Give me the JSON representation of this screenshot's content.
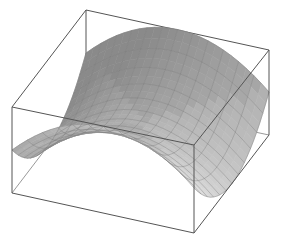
{
  "chart_data": {
    "type": "surface3d",
    "title": "",
    "xlabel": "",
    "ylabel": "",
    "zlabel": "",
    "function": "z = x^2 - y^2",
    "x_range": [
      -1,
      1
    ],
    "y_range": [
      -1,
      1
    ],
    "z_range": [
      -1,
      1
    ],
    "mesh_lines": 12,
    "grid": false,
    "legend": "none",
    "box": {
      "back_top": [
        86,
        10
      ],
      "right_top": [
        269,
        50
      ],
      "left_top": [
        12,
        107
      ],
      "front_top": [
        194,
        145
      ],
      "left_bottom": [
        12,
        193
      ],
      "front_bottom": [
        194,
        233
      ],
      "right_bottom": [
        269,
        135
      ],
      "back_bottom": [
        86,
        96
      ]
    },
    "colors": {
      "box_line": "#555555",
      "surface_light": "#e6e6e6",
      "surface_dark": "#8a8a8a",
      "mesh": "#7a7a7a"
    }
  }
}
